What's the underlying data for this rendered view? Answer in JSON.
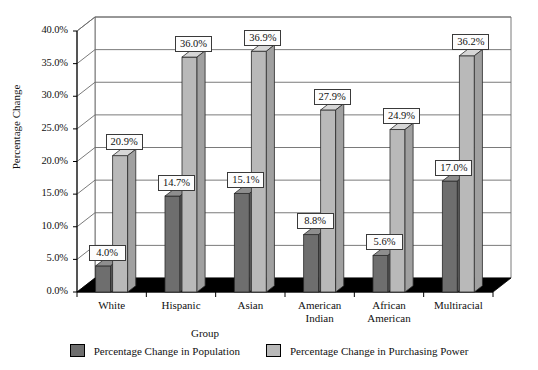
{
  "chart_data": {
    "type": "bar",
    "title": "",
    "subtitle": "",
    "xlabel": "Group",
    "ylabel": "Percentage Change",
    "categories": [
      "White",
      "Hispanic",
      "Asian",
      "American Indian",
      "African American",
      "Multiracial"
    ],
    "series": [
      {
        "name": "Percentage Change in Population",
        "color": "#6e6e6e",
        "values": [
          4.0,
          14.7,
          15.1,
          8.8,
          5.6,
          17.0
        ],
        "labels": [
          "4.0%",
          "14.7%",
          "15.1%",
          "8.8%",
          "5.6%",
          "17.0%"
        ]
      },
      {
        "name": "Percentage Change in Purchasing Power",
        "color": "#b9b9b9",
        "values": [
          20.9,
          36.0,
          36.9,
          27.9,
          24.9,
          36.2
        ],
        "labels": [
          "20.9%",
          "36.0%",
          "36.9%",
          "27.9%",
          "24.9%",
          "36.2%"
        ]
      }
    ],
    "ylim": [
      0,
      40
    ],
    "ytick_labels": [
      "0.0%",
      "5.0%",
      "10.0%",
      "15.0%",
      "20.0%",
      "25.0%",
      "30.0%",
      "35.0%",
      "40.0%"
    ],
    "ytick_values": [
      0,
      5,
      10,
      15,
      20,
      25,
      30,
      35,
      40
    ],
    "grid": true,
    "legend_position": "bottom",
    "style": "3d-column",
    "colors": {
      "population_bar": "#6e6e6e",
      "purchasing_power_bar": "#b9b9b9",
      "floor": "#000000",
      "wall": "#ffffff",
      "axis": "#000000",
      "label_box_bg": "#fdfdfd"
    }
  },
  "x_categories_wrapped": [
    [
      "White"
    ],
    [
      "Hispanic"
    ],
    [
      "Asian"
    ],
    [
      "American",
      "Indian"
    ],
    [
      "African",
      "American"
    ],
    [
      "Multiracial"
    ]
  ],
  "legend": {
    "items": [
      {
        "label": "Percentage Change in Population",
        "swatch": "#6e6e6e"
      },
      {
        "label": "Percentage Change in Purchasing Power",
        "swatch": "#b9b9b9"
      }
    ]
  }
}
